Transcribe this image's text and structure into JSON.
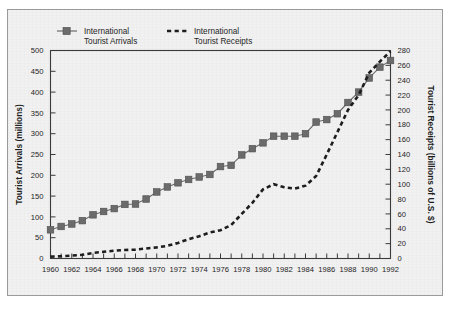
{
  "figure": {
    "background_color": "#f1f1f1",
    "frame_color": "#9a9a9a"
  },
  "chart_data": {
    "type": "line",
    "title": "",
    "subtitle": "",
    "xlabel": "",
    "ylabel": "Tourist Arrivals (millions)",
    "y2label": "Tourist Receipts (billions of U.S. $)",
    "xlim": [
      1960,
      1992
    ],
    "ylim": [
      0,
      500
    ],
    "y2lim": [
      0,
      280
    ],
    "grid": false,
    "legend_position": "top",
    "x_tick_step": 1,
    "x_label_step": 2,
    "y_tick_step": 50,
    "y2_tick_step": 20,
    "x": [
      1960,
      1961,
      1962,
      1963,
      1964,
      1965,
      1966,
      1967,
      1968,
      1969,
      1970,
      1971,
      1972,
      1973,
      1974,
      1975,
      1976,
      1977,
      1978,
      1979,
      1980,
      1981,
      1982,
      1983,
      1984,
      1985,
      1986,
      1987,
      1988,
      1989,
      1990,
      1991,
      1992
    ],
    "xticklabels": [
      "1960",
      "1962",
      "1964",
      "1966",
      "1968",
      "1970",
      "1972",
      "1974",
      "1976",
      "1978",
      "1980",
      "1982",
      "1984",
      "1986",
      "1988",
      "1990",
      "1992"
    ],
    "yticklabels": [
      "0",
      "50",
      "100",
      "150",
      "200",
      "250",
      "300",
      "350",
      "400",
      "450",
      "500"
    ],
    "y2ticklabels": [
      "0",
      "20",
      "40",
      "60",
      "80",
      "100",
      "120",
      "140",
      "160",
      "180",
      "200",
      "220",
      "240",
      "260",
      "280"
    ],
    "series": [
      {
        "name": "International Tourist Arrivals",
        "axis": "left",
        "marker": "square",
        "linestyle": "solid",
        "color": "#6b6b6b",
        "values": [
          69,
          77,
          83,
          91,
          105,
          113,
          120,
          130,
          131,
          143,
          160,
          172,
          182,
          190,
          196,
          202,
          221,
          224,
          249,
          264,
          278,
          294,
          294,
          294,
          300,
          328,
          334,
          348,
          375,
          400,
          434,
          460,
          476
        ]
      },
      {
        "name": "International Tourist Receipts",
        "axis": "right",
        "marker": "none",
        "linestyle": "dashed",
        "color": "#1d1d1d",
        "values": [
          2.5,
          3,
          4,
          5,
          7.5,
          9,
          10.5,
          11.5,
          12,
          13.5,
          15,
          17,
          21,
          26,
          30,
          35,
          38,
          45,
          60,
          75,
          93,
          100,
          96,
          94,
          98,
          111,
          140,
          170,
          200,
          220,
          250,
          265,
          279
        ]
      }
    ]
  },
  "legend": {
    "items": [
      {
        "label_line1": "International",
        "label_line2": "Tourist Arrivals",
        "marker": "square-with-line",
        "color": "#6b6b6b"
      },
      {
        "label_line1": "International",
        "label_line2": "Tourist Receipts",
        "marker": "dashed-line",
        "color": "#1d1d1d"
      }
    ]
  }
}
